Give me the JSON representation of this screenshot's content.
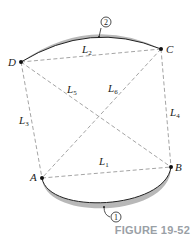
{
  "figure": {
    "caption": "FIGURE 19-52",
    "points": {
      "A": {
        "label": "A",
        "x": 42,
        "y": 178
      },
      "B": {
        "label": "B",
        "x": 171,
        "y": 167
      },
      "C": {
        "label": "C",
        "x": 161,
        "y": 49
      },
      "D": {
        "label": "D",
        "x": 21,
        "y": 62
      }
    },
    "segments": [
      {
        "id": "L1",
        "label": "L",
        "sub": "1",
        "from": "A",
        "to": "B"
      },
      {
        "id": "L2",
        "label": "L",
        "sub": "2",
        "from": "D",
        "to": "C"
      },
      {
        "id": "L3",
        "label": "L",
        "sub": "3",
        "from": "D",
        "to": "A"
      },
      {
        "id": "L4",
        "label": "L",
        "sub": "4",
        "from": "C",
        "to": "B"
      },
      {
        "id": "L5",
        "label": "L",
        "sub": "5",
        "from": "D",
        "to": "B"
      },
      {
        "id": "L6",
        "label": "L",
        "sub": "6",
        "from": "C",
        "to": "A"
      }
    ],
    "arcs": [
      {
        "id": "arc1",
        "callout": "1",
        "from": "A",
        "to": "B",
        "side": "bottom"
      },
      {
        "id": "arc2",
        "callout": "2",
        "from": "D",
        "to": "C",
        "side": "top"
      }
    ],
    "colors": {
      "arc_fill": "#b8b8b8",
      "arc_stroke": "#222222",
      "dashed": "#9a9a9a",
      "caption": "#9aa0a6"
    }
  }
}
